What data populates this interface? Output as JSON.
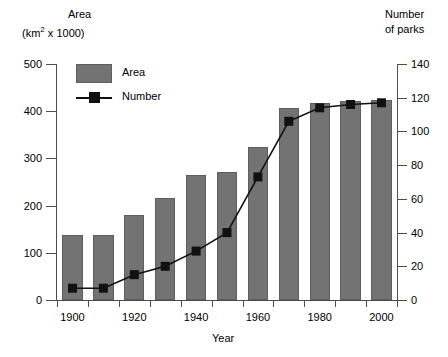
{
  "chart_data": {
    "type": "bar",
    "title": "",
    "xlabel": "Year",
    "ylabel": "Area (km2 x 1000)",
    "y2label": "Number of parks",
    "categories": [
      "1900",
      "1910",
      "1920",
      "1930",
      "1940",
      "1950",
      "1960",
      "1970",
      "1980",
      "1990",
      "2000"
    ],
    "xlim": [
      1895,
      2005
    ],
    "xticks_major": [
      "1900",
      "1920",
      "1940",
      "1960",
      "1980",
      "2000"
    ],
    "xticks_minor": [
      "1910",
      "1930",
      "1950",
      "1970",
      "1990"
    ],
    "ylim": [
      0,
      500
    ],
    "yticks": [
      "0",
      "100",
      "200",
      "300",
      "400",
      "500"
    ],
    "y2lim": [
      0,
      140
    ],
    "y2ticks": [
      "0",
      "20",
      "40",
      "60",
      "80",
      "100",
      "120",
      "140"
    ],
    "grid": false,
    "legend_position": "top-left-inside",
    "series": [
      {
        "name": "Area",
        "type": "bar",
        "axis": "left",
        "color": "#737373",
        "values": [
          138,
          138,
          180,
          216,
          265,
          271,
          324,
          407,
          418,
          421,
          423
        ]
      },
      {
        "name": "Number",
        "type": "line",
        "axis": "right",
        "color": "#111111",
        "marker": "square",
        "values": [
          7,
          7,
          15,
          20,
          29,
          40,
          73,
          106,
          114,
          116,
          117
        ]
      }
    ]
  },
  "labels": {
    "left_axis_title_line1": "Area",
    "left_axis_title_line2_pre": "(km",
    "left_axis_title_line2_sup": "2",
    "left_axis_title_line2_post": " x 1000)",
    "right_axis_title_line1": "Number",
    "right_axis_title_line2": "of parks",
    "x_axis_title": "Year"
  },
  "legend": {
    "items": [
      {
        "label": "Area",
        "marker": "filled-rectangle",
        "color": "#737373"
      },
      {
        "label": "Number",
        "marker": "line-with-square",
        "color": "#111111"
      }
    ]
  },
  "colors": {
    "bar_fill": "#737373",
    "bar_stroke": "#5e5e5e",
    "line": "#111111",
    "axis": "#4d4d4d",
    "text": "#000000",
    "background": "#ffffff"
  }
}
